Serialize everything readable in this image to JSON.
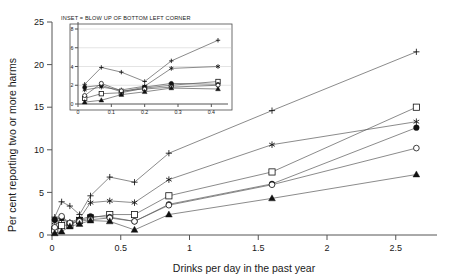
{
  "chart_data": {
    "type": "line",
    "title": "",
    "inset_title": "INSET = BLOW UP OF BOTTOM LEFT CORNER",
    "xlabel": "Drinks per day in the past year",
    "ylabel": "Per cent reporting two or more harms",
    "xlim": [
      0,
      2.8
    ],
    "ylim": [
      0,
      25
    ],
    "xticks": [
      0,
      0.5,
      1,
      1.5,
      2,
      2.5
    ],
    "xticklabels": [
      "0",
      "0.5",
      "1",
      "1.5",
      "2",
      "2.5"
    ],
    "yticks": [
      0,
      5,
      10,
      15,
      20,
      25
    ],
    "yticklabels": [
      "0",
      "5",
      "10",
      "15",
      "20",
      "25"
    ],
    "grid": false,
    "legend": "none",
    "x": [
      0.02,
      0.07,
      0.13,
      0.2,
      0.28,
      0.42,
      0.6,
      0.85,
      1.6,
      2.65
    ],
    "series": [
      {
        "name": "series-plus",
        "marker": "plus",
        "values": [
          2.1,
          3.9,
          3.4,
          2.4,
          4.6,
          6.8,
          6.2,
          9.6,
          14.6,
          21.5
        ]
      },
      {
        "name": "series-star",
        "marker": "star",
        "values": [
          1.5,
          1.8,
          1.5,
          1.9,
          3.8,
          4.0,
          3.8,
          6.5,
          10.6,
          13.3
        ]
      },
      {
        "name": "series-square-open",
        "marker": "square-open",
        "values": [
          0.6,
          1.1,
          1.2,
          1.7,
          2.0,
          2.4,
          2.4,
          4.6,
          7.4,
          15.0
        ]
      },
      {
        "name": "series-circle-filled",
        "marker": "circle-filled",
        "values": [
          1.8,
          2.0,
          1.3,
          1.8,
          2.2,
          2.1,
          1.6,
          3.6,
          6.0,
          12.6
        ]
      },
      {
        "name": "series-circle-open",
        "marker": "circle-open",
        "values": [
          0.9,
          2.2,
          1.4,
          1.6,
          1.8,
          2.0,
          1.6,
          3.5,
          5.9,
          10.2
        ]
      },
      {
        "name": "series-triangle-filled",
        "marker": "triangle-filled",
        "values": [
          0.2,
          0.4,
          1.0,
          1.3,
          1.7,
          1.6,
          0.6,
          2.4,
          4.3,
          7.1
        ]
      }
    ],
    "inset": {
      "xlim": [
        0,
        0.45
      ],
      "ylim": [
        0,
        8
      ],
      "xticks": [
        0,
        0.1,
        0.2,
        0.3,
        0.4
      ],
      "xticklabels": [
        "0",
        "0.1",
        "0.2",
        "0.3",
        "0.4"
      ],
      "yticks": [
        0,
        2,
        4,
        6,
        8
      ],
      "yticklabels": [
        "0",
        "2",
        "4",
        "6",
        "8"
      ],
      "grid": true,
      "x": [
        0.02,
        0.07,
        0.13,
        0.2,
        0.28,
        0.42
      ],
      "series": [
        {
          "name": "series-plus",
          "marker": "plus",
          "values": [
            2.1,
            3.9,
            3.4,
            2.4,
            4.6,
            6.8
          ]
        },
        {
          "name": "series-star",
          "marker": "star",
          "values": [
            1.5,
            1.8,
            1.5,
            1.9,
            3.8,
            4.0
          ]
        },
        {
          "name": "series-square-open",
          "marker": "square-open",
          "values": [
            0.6,
            1.1,
            1.2,
            1.7,
            2.0,
            2.4
          ]
        },
        {
          "name": "series-circle-filled",
          "marker": "circle-filled",
          "values": [
            1.8,
            2.0,
            1.3,
            1.8,
            2.2,
            2.1
          ]
        },
        {
          "name": "series-circle-open",
          "marker": "circle-open",
          "values": [
            0.9,
            2.2,
            1.4,
            1.6,
            1.8,
            2.0
          ]
        },
        {
          "name": "series-triangle-filled",
          "marker": "triangle-filled",
          "values": [
            0.2,
            0.4,
            1.0,
            1.3,
            1.7,
            1.6
          ]
        }
      ]
    },
    "colors": {
      "line": "#595959",
      "marker": "#111111",
      "axis": "#555555",
      "grid": "#c9c9c9",
      "background": "#ffffff"
    }
  }
}
